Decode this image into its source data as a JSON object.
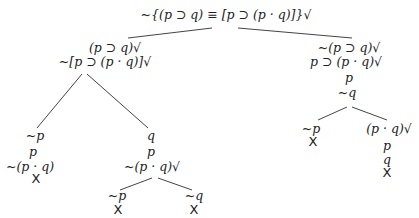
{
  "tree": {
    "root": "~{(p ⊃ q) ≡ [p ⊃ (p · q)]}√",
    "left_branch": {
      "lines": [
        "(p ⊃ q)√",
        "~[p ⊃ (p · q)]√"
      ],
      "left": {
        "lines": [
          "~p",
          "p",
          "~(p · q)"
        ],
        "closed": "X"
      },
      "right": {
        "lines": [
          "q",
          "p",
          "~(p · q)√"
        ],
        "left": {
          "lines": [
            "~p"
          ],
          "closed": "X"
        },
        "right": {
          "lines": [
            "~q"
          ],
          "closed": "X"
        }
      }
    },
    "right_branch": {
      "lines": [
        "~(p ⊃ q)√",
        "p ⊃ (p · q)√",
        "p",
        "~q"
      ],
      "left": {
        "lines": [
          "~p"
        ],
        "closed": "X"
      },
      "right": {
        "lines": [
          "(p · q)√",
          "p",
          "q"
        ],
        "closed": "X"
      }
    }
  }
}
